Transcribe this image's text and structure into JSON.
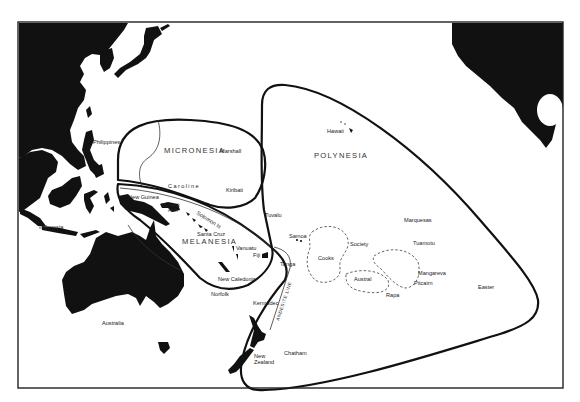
{
  "map": {
    "regions": [
      {
        "name": "micronesia",
        "label": "MICRONESIA"
      },
      {
        "name": "melanesia",
        "label": "MELANESIA"
      },
      {
        "name": "polynesia",
        "label": "POLYNESIA"
      }
    ],
    "places": {
      "philippines": "Philippines",
      "indonesia": "Indonesia",
      "new_guinea": "New Guinea",
      "bismarck": "Bismarck",
      "arch": "Arch",
      "solomon": "Solomon Is",
      "santa_cruz": "Santa Cruz",
      "vanuatu": "Vanuatu",
      "fiji": "Fiji",
      "new_caledonia": "New Caledonia",
      "norfolk": "Norfolk",
      "australia": "Australia",
      "caroline": "Caroline",
      "marshall": "Marshall",
      "kiribati": "Kiribati",
      "tuvalu": "Tuvalu",
      "samoa": "Samoa",
      "tonga": "Tonga",
      "kermadec": "Kermadec",
      "new_zealand_1": "New",
      "new_zealand_2": "Zealand",
      "chatham": "Chatham",
      "hawaii": "Hawaii",
      "cooks": "Cooks",
      "society": "Society",
      "austral": "Austral",
      "rapa": "Rapa",
      "marquesas": "Marquesas",
      "tuamotu": "Tuamotu",
      "mangareva": "Mangareva",
      "pitcairn": "Pitcairn",
      "easter": "Easter"
    },
    "annotations": {
      "andesite_line": "ANDESITE LINE"
    },
    "colors": {
      "land": "#111111",
      "boundary": "#111111",
      "background": "#ffffff"
    }
  }
}
